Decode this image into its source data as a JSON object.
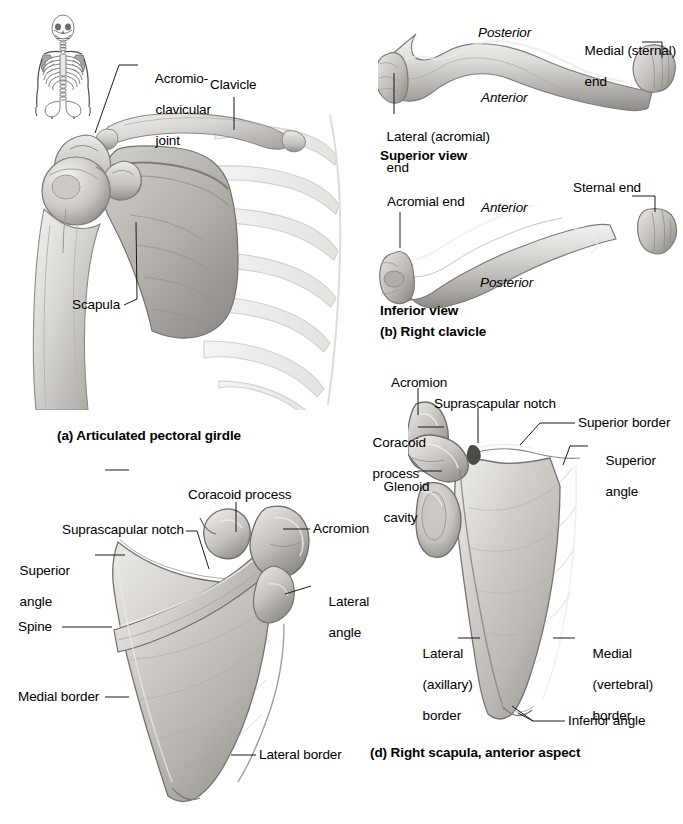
{
  "figure": {
    "kind": "anatomy-plate",
    "background": "#ffffff",
    "bone_fill": "#d2d0cc",
    "bone_shade": "#9a9793",
    "leader_color": "#1a1a1a"
  },
  "panel_a": {
    "caption": "(a) Articulated pectoral girdle",
    "labels": {
      "acromioclavicular_joint": "Acromio-\nclavicular\njoint",
      "acromioclavicular_joint_line1": "Acromio-",
      "acromioclavicular_joint_line2": "clavicular",
      "acromioclavicular_joint_line3": "joint",
      "clavicle": "Clavicle",
      "scapula": "Scapula"
    },
    "inset": {
      "name": "skeleton-orientation-inset",
      "description": "anterior whole-skeleton thumbnail with shoulder girdle shaded"
    }
  },
  "panel_b": {
    "caption": "(b) Right clavicle",
    "superior": {
      "view_caption": "Superior view",
      "labels": {
        "posterior": "Posterior",
        "anterior": "Anterior",
        "medial_sternal_end_line1": "Medial (sternal)",
        "medial_sternal_end_line2": "end",
        "lateral_acromial_end_line1": "Lateral (acromial)",
        "lateral_acromial_end_line2": "end"
      }
    },
    "inferior": {
      "view_caption": "Inferior view",
      "labels": {
        "acromial_end": "Acromial end",
        "anterior": "Anterior",
        "posterior": "Posterior",
        "sternal_end": "Sternal end"
      }
    }
  },
  "panel_c": {
    "caption": "",
    "labels": {
      "coracoid_process": "Coracoid process",
      "suprascapular_notch": "Suprascapular notch",
      "superior_angle_line1": "Superior",
      "superior_angle_line2": "angle",
      "acromion": "Acromion",
      "lateral_angle_line1": "Lateral",
      "lateral_angle_line2": "angle",
      "spine": "Spine",
      "medial_border": "Medial border",
      "lateral_border": "Lateral border"
    }
  },
  "panel_d": {
    "caption": "(d) Right scapula, anterior aspect",
    "labels": {
      "acromion": "Acromion",
      "suprascapular_notch": "Suprascapular notch",
      "superior_border": "Superior border",
      "superior_angle_line1": "Superior",
      "superior_angle_line2": "angle",
      "coracoid_process_line1": "Coracoid",
      "coracoid_process_line2": "process",
      "glenoid_cavity_line1": "Glenoid",
      "glenoid_cavity_line2": "cavity",
      "lateral_axillary_border_line1": "Lateral",
      "lateral_axillary_border_line2": "(axillary)",
      "lateral_axillary_border_line3": "border",
      "medial_vertebral_border_line1": "Medial",
      "medial_vertebral_border_line2": "(vertebral)",
      "medial_vertebral_border_line3": "border",
      "inferior_angle": "Inferior angle"
    }
  }
}
